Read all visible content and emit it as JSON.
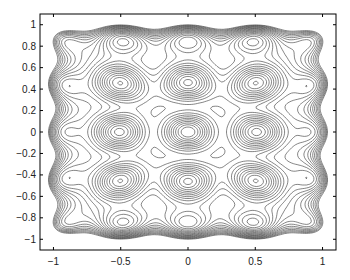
{
  "chart_data": {
    "type": "contour",
    "title": "",
    "xlabel": "",
    "ylabel": "",
    "xlim": [
      -1.1,
      1.1
    ],
    "ylim": [
      -1.1,
      1.1
    ],
    "grid": false,
    "legend": null,
    "x_ticks": [
      -1,
      -0.5,
      0,
      0.5,
      1
    ],
    "x_tick_labels": [
      "−1",
      "−0.5",
      "0",
      "0.5",
      "1"
    ],
    "y_ticks": [
      1,
      0.8,
      0.6,
      0.4,
      0.2,
      0,
      -0.2,
      -0.4,
      -0.6,
      -0.8,
      -1
    ],
    "y_tick_labels": [
      "1",
      "0.8",
      "0.6",
      "0.4",
      "0.2",
      "0",
      "−0.2",
      "−0.4",
      "−0.6",
      "−0.8",
      "−1"
    ],
    "line_color": "#333333",
    "local_maxima_approx": [
      [
        0,
        0
      ],
      [
        -0.5,
        0
      ],
      [
        0.5,
        0
      ],
      [
        0,
        0.45
      ],
      [
        0,
        -0.45
      ],
      [
        -0.5,
        0.45
      ],
      [
        0.5,
        0.45
      ],
      [
        -0.5,
        -0.45
      ],
      [
        0.5,
        -0.45
      ],
      [
        -0.3,
        0.28
      ],
      [
        0.3,
        0.28
      ],
      [
        -0.3,
        -0.28
      ],
      [
        0.3,
        -0.28
      ]
    ],
    "num_levels": 24
  }
}
